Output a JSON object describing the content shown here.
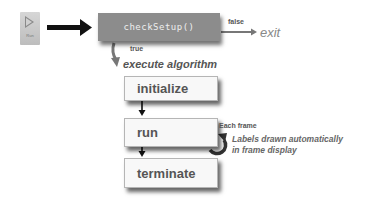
{
  "run_button": {
    "label": "Run",
    "icon": "play-icon"
  },
  "nodes": {
    "check_setup": "checkSetup()",
    "initialize": "initialize",
    "run": "run",
    "terminate": "terminate"
  },
  "edges": {
    "false_label": "false",
    "true_label": "true",
    "exit_label": "exit",
    "execute_label": "execute algorithm"
  },
  "loop_note": {
    "heading": "Each frame",
    "line1": "Labels drawn automatically",
    "line2": "in frame display"
  },
  "colors": {
    "check_box": "#8c8c8c",
    "step_box": "#f8f8f8",
    "arrow": "#111111",
    "text": "#555555"
  }
}
